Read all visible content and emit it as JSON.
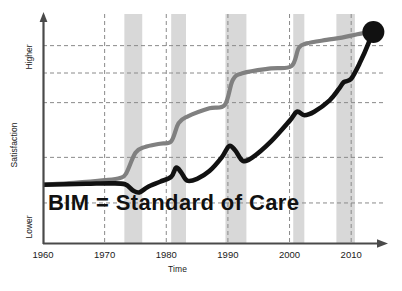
{
  "chart_data": {
    "type": "line",
    "title": "",
    "xlabel": "Time",
    "ylabel": "Satisfaction",
    "xlim": [
      1960,
      2015
    ],
    "ylim": [
      0,
      100
    ],
    "grid": true,
    "legend_position": "none",
    "x_tick_labels": [
      "1960",
      "1970",
      "1980",
      "1990",
      "2000",
      "2010"
    ],
    "x_ticks": [
      1960,
      1970,
      1980,
      1990,
      2000,
      2010
    ],
    "y_axis_endcaps": {
      "top": "Higher",
      "bottom": "Lower"
    },
    "y_gridlines": [
      18,
      38,
      62,
      75,
      87
    ],
    "annotations": [
      {
        "text": "BIM = Standard of Care",
        "x": 1963,
        "y": 22
      }
    ],
    "shaded_bands": [
      {
        "label": "recession-band-1",
        "start": 1973.2,
        "end": 1976.1
      },
      {
        "label": "recession-band-2",
        "start": 1980.8,
        "end": 1983.2
      },
      {
        "label": "recession-band-3",
        "start": 1989.6,
        "end": 1993.0
      },
      {
        "label": "recession-band-4",
        "start": 2000.6,
        "end": 2002.4
      },
      {
        "label": "recession-band-5",
        "start": 2007.6,
        "end": 2010.6
      }
    ],
    "series": [
      {
        "name": "technology-capability",
        "color": "#808080",
        "style": "stepped-rise",
        "points": [
          [
            1960,
            26
          ],
          [
            1965,
            26.8
          ],
          [
            1970,
            28
          ],
          [
            1972.5,
            29
          ],
          [
            1973.5,
            31
          ],
          [
            1975.0,
            40
          ],
          [
            1976.5,
            42.5
          ],
          [
            1979,
            44
          ],
          [
            1980.8,
            45
          ],
          [
            1982,
            53
          ],
          [
            1983.5,
            56
          ],
          [
            1987,
            59.5
          ],
          [
            1989.5,
            61
          ],
          [
            1990.8,
            72
          ],
          [
            1992.5,
            75
          ],
          [
            1997,
            77
          ],
          [
            2000.3,
            78
          ],
          [
            2001.5,
            86
          ],
          [
            2002.8,
            88
          ],
          [
            2006,
            89.5
          ],
          [
            2008.5,
            90.5
          ],
          [
            2011,
            92
          ],
          [
            2013.4,
            93
          ]
        ]
      },
      {
        "name": "project-satisfaction",
        "color": "#111111",
        "style": "sawtooth-rise",
        "points": [
          [
            1960,
            26
          ],
          [
            1967,
            26.4
          ],
          [
            1971,
            26.6
          ],
          [
            1973.3,
            26.2
          ],
          [
            1974.6,
            23.5
          ],
          [
            1975.6,
            22.6
          ],
          [
            1977,
            25.0
          ],
          [
            1979,
            27.3
          ],
          [
            1980.8,
            29.5
          ],
          [
            1981.6,
            33.5
          ],
          [
            1982.4,
            31.5
          ],
          [
            1983.4,
            27.8
          ],
          [
            1985,
            28.6
          ],
          [
            1987,
            32
          ],
          [
            1989,
            38
          ],
          [
            1990.2,
            43
          ],
          [
            1991.2,
            41
          ],
          [
            1992.4,
            36.5
          ],
          [
            1994,
            38
          ],
          [
            1997,
            45
          ],
          [
            2000,
            54
          ],
          [
            2001.2,
            58
          ],
          [
            2002.4,
            56.5
          ],
          [
            2004,
            58
          ],
          [
            2006.5,
            63
          ],
          [
            2008,
            68
          ],
          [
            2008.8,
            71
          ],
          [
            2010,
            72.5
          ],
          [
            2011.5,
            80
          ],
          [
            2012.8,
            88
          ],
          [
            2013.4,
            93
          ]
        ]
      }
    ],
    "convergence_marker": {
      "name": "end-dot",
      "x": 2013.6,
      "y": 93,
      "color": "#111111",
      "radius": 11
    },
    "band_color": "#d8d8d8",
    "gridline_color": "#8a8a8a",
    "axis_color": "#4a4a4a"
  },
  "axes": {
    "x_title": "Time",
    "y_title": "Satisfaction",
    "y_high_label": "Higher",
    "y_low_label": "Lower"
  },
  "annotation": {
    "headline": "BIM = Standard of Care"
  }
}
